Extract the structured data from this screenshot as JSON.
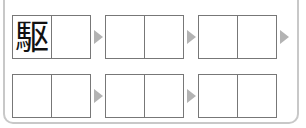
{
  "colors": {
    "frame": "#c8c8c8",
    "box_border": "#777777",
    "arrow": "#b3b3b3"
  },
  "rows": [
    {
      "boxes": [
        {
          "cells": [
            "駆",
            ""
          ]
        },
        {
          "cells": [
            "",
            ""
          ]
        },
        {
          "cells": [
            "",
            ""
          ]
        }
      ]
    },
    {
      "boxes": [
        {
          "cells": [
            "",
            ""
          ]
        },
        {
          "cells": [
            "",
            ""
          ]
        },
        {
          "cells": [
            "",
            ""
          ]
        }
      ]
    }
  ]
}
